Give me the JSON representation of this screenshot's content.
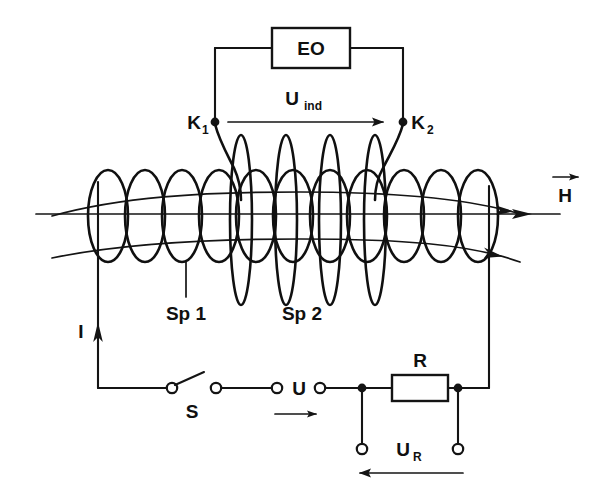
{
  "figure": {
    "background_color": "#ffffff",
    "ink_color": "#141414",
    "width": 597,
    "height": 486
  },
  "labels": {
    "oscilloscope": "EO",
    "induced_voltage": "U",
    "induced_voltage_sub": "ind",
    "terminal_1": "K",
    "terminal_1_sub": "1",
    "terminal_2": "K",
    "terminal_2_sub": "2",
    "coil_primary": "Sp 1",
    "coil_secondary": "Sp 2",
    "field_strength": "H",
    "current": "I",
    "switch": "S",
    "supply_voltage": "U",
    "resistor": "R",
    "resistor_voltage": "U",
    "resistor_voltage_sub": "R"
  },
  "components": [
    {
      "name": "oscilloscope-box",
      "label": "EO",
      "type": "instrument"
    },
    {
      "name": "secondary-coil",
      "label": "Sp 2",
      "type": "coil",
      "turns": 4
    },
    {
      "name": "primary-coil",
      "label": "Sp 1",
      "type": "solenoid",
      "turns": 11
    },
    {
      "name": "switch",
      "label": "S",
      "type": "switch",
      "state": "open"
    },
    {
      "name": "resistor",
      "label": "R",
      "type": "resistor"
    },
    {
      "name": "terminal-k1",
      "label": "K1",
      "type": "terminal"
    },
    {
      "name": "terminal-k2",
      "label": "K2",
      "type": "terminal"
    }
  ],
  "annotations": {
    "u_ind_arrow_direction": "right",
    "h_arrow_direction": "right",
    "i_arrow_direction": "up",
    "u_arrow_direction": "right",
    "ur_arrow_direction": "left"
  }
}
